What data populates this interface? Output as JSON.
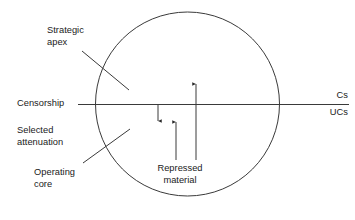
{
  "figure": {
    "type": "conceptual-diagram",
    "background_color": "#ffffff",
    "stroke_color": "#3a3a3a",
    "text_color": "#1a1a1a"
  },
  "labels": {
    "strategic_apex": "Strategic\napex",
    "censorship": "Censorship",
    "selected_attenuation": "Selected\nattenuation",
    "operating_core": "Operating\ncore",
    "repressed_material": "Repressed\nmaterial",
    "cs": "Cs",
    "ucs": "UCs"
  },
  "shapes": {
    "circle": {
      "name": "organization-boundary-circle",
      "cx": 187.5,
      "cy": 104,
      "r": 92
    },
    "censorship_line": {
      "name": "censorship-divider-line",
      "x1": 78,
      "y1": 104,
      "x2": 349,
      "y2": 104
    },
    "leader_strategic_apex": {
      "x1": 82,
      "y1": 51,
      "x2": 129,
      "y2": 90
    },
    "leader_operating_core": {
      "x1": 83,
      "y1": 163,
      "x2": 130,
      "y2": 129
    },
    "arrows": [
      {
        "name": "downward-censorship-arrow",
        "direction": "down",
        "x": 158,
        "y_start": 104,
        "y_end": 121
      },
      {
        "name": "upward-repressed-arrow-short",
        "direction": "up",
        "x": 176,
        "y_start": 160,
        "y_end": 122
      },
      {
        "name": "upward-repressed-arrow-long",
        "direction": "up",
        "x": 196,
        "y_start": 160,
        "y_end": 84
      }
    ]
  }
}
